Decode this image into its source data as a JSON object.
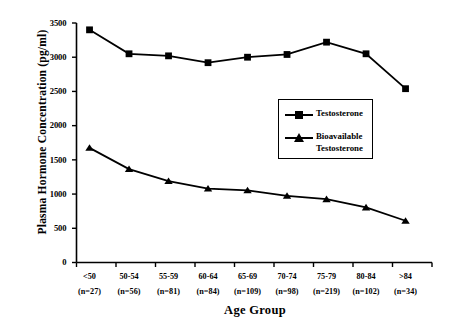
{
  "chart_data": {
    "type": "line",
    "title": "",
    "subtitle": "",
    "xlabel": "Age Group",
    "ylabel": "Plasma Hormone Concentration (pg/ml)",
    "categories": [
      "<50",
      "50-54",
      "55-59",
      "60-64",
      "65-69",
      "70-74",
      "75-79",
      "80-84",
      ">84"
    ],
    "category_counts": [
      "(n=27)",
      "(n=56)",
      "(n=81)",
      "(n=84)",
      "(n=109)",
      "(n=98)",
      "(n=219)",
      "(n=102)",
      "(n=34)"
    ],
    "ylim": [
      0,
      3500
    ],
    "yticks": [
      0,
      500,
      1000,
      1500,
      2000,
      2500,
      3000,
      3500
    ],
    "ytick_labels": [
      "0",
      "500",
      "1000",
      "1500",
      "2000",
      "2500",
      "3000",
      "3500"
    ],
    "grid": false,
    "legend_position": "center-right",
    "series": [
      {
        "name": "Testosterone",
        "marker": "square",
        "color": "#000000",
        "values": [
          3400,
          3050,
          3020,
          2920,
          3000,
          3040,
          3220,
          3050,
          2540
        ]
      },
      {
        "name": "Bioavailable Testosterone",
        "marker": "triangle",
        "color": "#000000",
        "values": [
          1675,
          1365,
          1190,
          1080,
          1055,
          975,
          925,
          805,
          610
        ]
      }
    ],
    "legend_entries": [
      {
        "label_line1": "Testosterone",
        "label_line2": "",
        "marker": "square"
      },
      {
        "label_line1": "Bioavailable",
        "label_line2": "Testosterone",
        "marker": "triangle"
      }
    ]
  },
  "axis": {
    "y_title": "Plasma Hormone Concentration (pg/ml)",
    "x_title": "Age Group"
  }
}
